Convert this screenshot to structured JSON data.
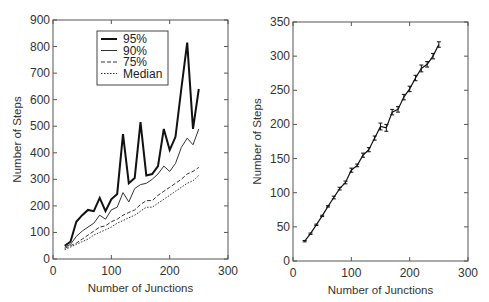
{
  "chart_data": [
    {
      "type": "line",
      "title": "",
      "xlabel": "Number of Junctions",
      "ylabel": "Number of Steps",
      "xlim": [
        0,
        300
      ],
      "ylim": [
        0,
        900
      ],
      "xticks": [
        0,
        100,
        200,
        300
      ],
      "yticks": [
        0,
        100,
        200,
        300,
        400,
        500,
        600,
        700,
        800,
        900
      ],
      "grid": false,
      "legend_position": "upper-left-inset",
      "x": [
        20,
        30,
        40,
        50,
        60,
        70,
        80,
        90,
        100,
        110,
        120,
        130,
        140,
        150,
        160,
        170,
        180,
        190,
        200,
        210,
        220,
        230,
        240,
        250
      ],
      "series": [
        {
          "name": "95%",
          "style": "solid-thick",
          "values": [
            50,
            65,
            140,
            165,
            185,
            180,
            230,
            180,
            225,
            245,
            470,
            285,
            305,
            515,
            315,
            320,
            350,
            490,
            410,
            460,
            640,
            815,
            490,
            640
          ]
        },
        {
          "name": "90%",
          "style": "solid-thin",
          "values": [
            45,
            55,
            85,
            105,
            120,
            135,
            165,
            150,
            185,
            195,
            250,
            215,
            265,
            280,
            285,
            300,
            320,
            350,
            330,
            360,
            420,
            455,
            430,
            490
          ]
        },
        {
          "name": "75%",
          "style": "dashed",
          "values": [
            40,
            50,
            60,
            75,
            90,
            105,
            120,
            125,
            140,
            150,
            165,
            175,
            185,
            205,
            220,
            220,
            240,
            255,
            270,
            285,
            300,
            320,
            330,
            345
          ]
        },
        {
          "name": "Median",
          "style": "dotted",
          "values": [
            35,
            45,
            55,
            65,
            75,
            90,
            100,
            110,
            120,
            135,
            145,
            155,
            165,
            180,
            195,
            195,
            210,
            225,
            240,
            255,
            270,
            285,
            295,
            315
          ]
        }
      ]
    },
    {
      "type": "line",
      "title": "",
      "xlabel": "Number of Junctions",
      "ylabel": "Number of Steps",
      "xlim": [
        0,
        300
      ],
      "ylim": [
        0,
        350
      ],
      "xticks": [
        0,
        100,
        200,
        300
      ],
      "yticks": [
        0,
        50,
        100,
        150,
        200,
        250,
        300,
        350
      ],
      "grid": false,
      "error_bars": true,
      "x": [
        20,
        30,
        40,
        50,
        60,
        70,
        80,
        90,
        100,
        110,
        120,
        130,
        140,
        150,
        160,
        170,
        180,
        190,
        200,
        210,
        220,
        230,
        240,
        250
      ],
      "series": [
        {
          "name": "Mean steps",
          "values": [
            29,
            40,
            53,
            66,
            80,
            93,
            106,
            115,
            133,
            140,
            155,
            163,
            180,
            197,
            195,
            218,
            222,
            240,
            252,
            268,
            282,
            288,
            300,
            317
          ],
          "error": [
            1,
            1,
            1,
            1,
            1,
            2,
            2,
            2,
            3,
            2,
            3,
            3,
            3,
            5,
            5,
            4,
            4,
            4,
            4,
            4,
            5,
            4,
            4,
            4
          ]
        }
      ]
    }
  ],
  "legend": [
    "95%",
    "90%",
    "75%",
    "Median"
  ]
}
